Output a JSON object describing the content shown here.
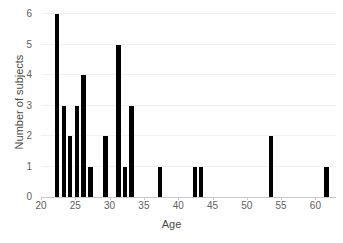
{
  "chart_data": {
    "type": "bar",
    "title": "",
    "xlabel": "Age",
    "ylabel": "Number of subjects",
    "xlim": [
      20,
      63
    ],
    "ylim": [
      0,
      6
    ],
    "xticks": [
      20,
      25,
      30,
      35,
      40,
      45,
      50,
      55,
      60
    ],
    "yticks": [
      0,
      1,
      2,
      3,
      4,
      5,
      6
    ],
    "grid": "horizontal",
    "legend": "none",
    "bar_color": "#000000",
    "background_color": "#ffffff",
    "gridline_color": "#f0f0f0",
    "tick_label_color": "#606060",
    "axis_label_color": "#4a4a4a",
    "bar_width_units": 0.62,
    "x": [
      22.3,
      23.3,
      24.2,
      25.2,
      26.2,
      27.2,
      29.4,
      31.3,
      32.2,
      33.2,
      37.4,
      42.5,
      43.3,
      53.5,
      61.6
    ],
    "values": [
      6,
      3,
      2,
      3,
      4,
      1,
      2,
      5,
      1,
      3,
      1,
      1,
      1,
      2,
      1
    ],
    "categories": [
      "22",
      "23",
      "24",
      "25",
      "26",
      "27",
      "29",
      "31",
      "32",
      "33",
      "37",
      "42",
      "43",
      "53",
      "61"
    ]
  }
}
